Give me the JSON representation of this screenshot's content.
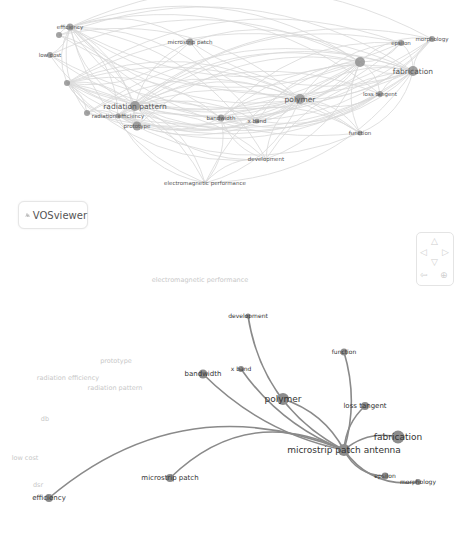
{
  "app": {
    "name": "VOSviewer"
  },
  "top_network": {
    "title": "Overall co-occurrence network",
    "nodes": [
      {
        "id": "efficiency",
        "label": "efficiency",
        "x": 70,
        "y": 27,
        "r": 3.5
      },
      {
        "id": "unlabeled-1",
        "label": "",
        "x": 59,
        "y": 35,
        "r": 3
      },
      {
        "id": "low-cost",
        "label": "low cost",
        "x": 50,
        "y": 55,
        "r": 3
      },
      {
        "id": "unlabeled-2",
        "label": "",
        "x": 67,
        "y": 83,
        "r": 3
      },
      {
        "id": "microstrip-patch",
        "label": "microstrip patch",
        "x": 190,
        "y": 42,
        "r": 3.5
      },
      {
        "id": "radiation-pattern",
        "label": "radiation pattern",
        "x": 135,
        "y": 106,
        "r": 5
      },
      {
        "id": "radiation-efficiency",
        "label": "radiation efficiency",
        "x": 118,
        "y": 116,
        "r": 2.5
      },
      {
        "id": "unlabeled-3",
        "label": "",
        "x": 87,
        "y": 113,
        "r": 3
      },
      {
        "id": "prototype",
        "label": "prototype",
        "x": 137,
        "y": 126,
        "r": 4.5
      },
      {
        "id": "bandwidth",
        "label": "bandwidth",
        "x": 221,
        "y": 118,
        "r": 3.5
      },
      {
        "id": "x-band",
        "label": "x band",
        "x": 257,
        "y": 121,
        "r": 2.5
      },
      {
        "id": "polymer",
        "label": "polymer",
        "x": 300,
        "y": 99,
        "r": 5
      },
      {
        "id": "unlabeled-hub",
        "label": "",
        "x": 360,
        "y": 62,
        "r": 5
      },
      {
        "id": "epsilon",
        "label": "epsilon",
        "x": 401,
        "y": 43,
        "r": 3
      },
      {
        "id": "morphology",
        "label": "morphology",
        "x": 432,
        "y": 39,
        "r": 3
      },
      {
        "id": "fabrication",
        "label": "fabrication",
        "x": 413,
        "y": 71,
        "r": 5
      },
      {
        "id": "loss-tangent",
        "label": "loss tangent",
        "x": 380,
        "y": 94,
        "r": 3
      },
      {
        "id": "function",
        "label": "function",
        "x": 360,
        "y": 133,
        "r": 2.5
      },
      {
        "id": "development",
        "label": "development",
        "x": 266,
        "y": 159,
        "r": 0
      },
      {
        "id": "electromagnetic-performance",
        "label": "electromagnetic performance",
        "x": 205,
        "y": 183,
        "r": 0
      }
    ]
  },
  "bottom_network": {
    "title": "Links of microstrip patch antenna",
    "center": {
      "id": "microstrip-patch-antenna",
      "label": "microstrip patch antenna",
      "x": 344,
      "y": 450,
      "r": 6
    },
    "nodes": [
      {
        "id": "development",
        "label": "development",
        "x": 248,
        "y": 316,
        "r": 2.5
      },
      {
        "id": "function",
        "label": "function",
        "x": 344,
        "y": 352,
        "r": 3.5
      },
      {
        "id": "x-band",
        "label": "x band",
        "x": 241,
        "y": 369,
        "r": 3
      },
      {
        "id": "bandwidth",
        "label": "bandwidth",
        "x": 203,
        "y": 374,
        "r": 4.5
      },
      {
        "id": "polymer",
        "label": "polymer",
        "x": 283,
        "y": 399,
        "r": 6
      },
      {
        "id": "loss-tangent",
        "label": "loss tangent",
        "x": 365,
        "y": 406,
        "r": 4
      },
      {
        "id": "fabrication",
        "label": "fabrication",
        "x": 398,
        "y": 437,
        "r": 6.5
      },
      {
        "id": "epsilon",
        "label": "epsilon",
        "x": 385,
        "y": 476,
        "r": 3.5
      },
      {
        "id": "morphology",
        "label": "morphology",
        "x": 418,
        "y": 482,
        "r": 3
      },
      {
        "id": "microstrip-patch",
        "label": "microstrip patch",
        "x": 170,
        "y": 478,
        "r": 4
      },
      {
        "id": "efficiency",
        "label": "efficiency",
        "x": 49,
        "y": 498,
        "r": 4
      }
    ],
    "faded_labels": [
      {
        "label": "electromagnetic performance",
        "x": 200,
        "y": 282
      },
      {
        "label": "prototype",
        "x": 116,
        "y": 363
      },
      {
        "label": "radiation efficiency",
        "x": 68,
        "y": 380
      },
      {
        "label": "radiation pattern",
        "x": 115,
        "y": 390
      },
      {
        "label": "db",
        "x": 45,
        "y": 421
      },
      {
        "label": "low cost",
        "x": 25,
        "y": 460
      },
      {
        "label": "dsr",
        "x": 38,
        "y": 487
      }
    ]
  },
  "navigation": {
    "up": "△",
    "left": "◁",
    "right": "▷",
    "down": "▽",
    "reset": "⇦",
    "zoom": "⊕"
  },
  "colors": {
    "node": "#8c8c8c",
    "edge_top": "#d6d6d6",
    "edge_bottom": "#8a8a8a",
    "label_top": "#555555",
    "label_bottom": "#333333",
    "faded": "#c8c8c8"
  }
}
